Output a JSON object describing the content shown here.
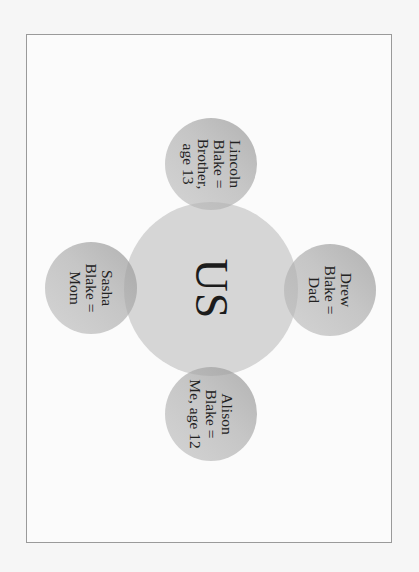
{
  "diagram": {
    "type": "hub-and-spoke circle diagram (rotated 90° clockwise)",
    "center": {
      "label": "US"
    },
    "nodes": [
      {
        "position": "top",
        "lines": [
          "Lincoln",
          "Blake =",
          "Brother,",
          "age 13"
        ]
      },
      {
        "position": "left",
        "lines": [
          "Sasha",
          "Blake =",
          "Mom"
        ]
      },
      {
        "position": "right",
        "lines": [
          "Drew",
          "Blake =",
          "Dad"
        ]
      },
      {
        "position": "bottom",
        "lines": [
          "Alison",
          "Blake =",
          "Me, age 12"
        ]
      }
    ],
    "colors": {
      "background": "#f6f6f6",
      "frame_border": "#9a9a9a",
      "center_fill": "#d4d4d4",
      "node_fill": "#bdbdbd",
      "text": "#222222"
    }
  }
}
